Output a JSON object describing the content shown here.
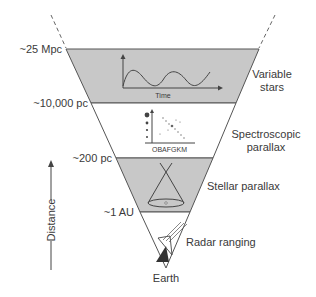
{
  "diagram": {
    "colors": {
      "band_gray": "#c8c8c8",
      "band_white": "#ffffff",
      "line": "#555555",
      "text": "#3a3a3a"
    },
    "distance_markers": [
      {
        "label": "~25 Mpc",
        "y": 49
      },
      {
        "label": "~10,000 pc",
        "y": 103
      },
      {
        "label": "~200 pc",
        "y": 158
      },
      {
        "label": "~1 AU",
        "y": 212
      }
    ],
    "methods": [
      {
        "label_lines": [
          "Variable",
          "stars"
        ],
        "shaded": true
      },
      {
        "label_lines": [
          "Spectroscopic",
          "parallax"
        ],
        "shaded": false
      },
      {
        "label_lines": [
          "Stellar parallax"
        ],
        "shaded": true
      },
      {
        "label_lines": [
          "Radar ranging"
        ],
        "shaded": false
      }
    ],
    "inset_labels": {
      "lightcurve_xaxis": "Time",
      "spectral_types": "OBAFGKM"
    },
    "apex_label": "Earth",
    "axis_label": "Distance"
  }
}
